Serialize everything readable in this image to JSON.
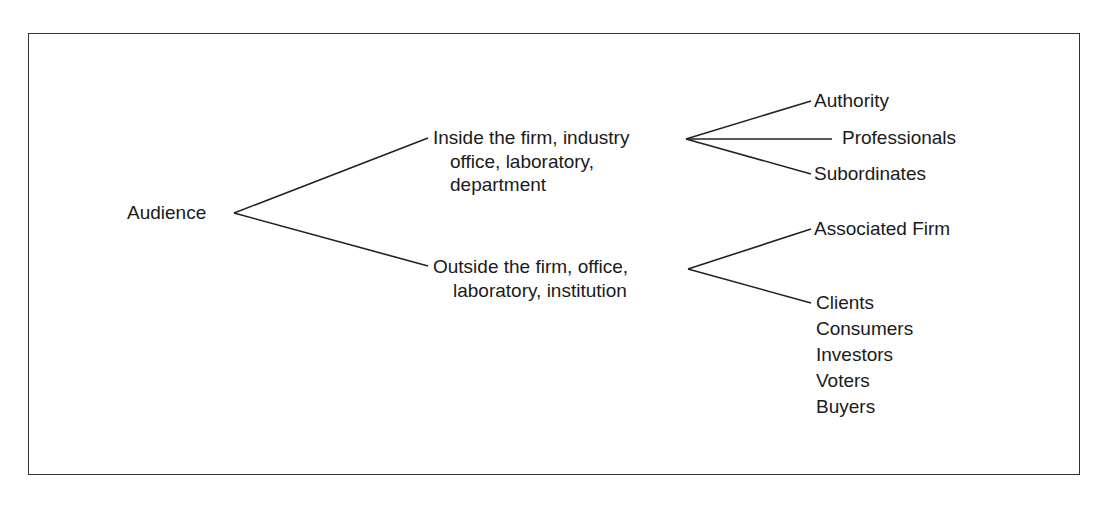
{
  "diagram": {
    "type": "tree",
    "root": "Audience",
    "branches": [
      {
        "label_lines": [
          "Inside the firm, industry",
          "office, laboratory,",
          "department"
        ],
        "children": [
          "Authority",
          "Professionals",
          "Subordinates"
        ]
      },
      {
        "label_lines": [
          "Outside the firm, office,",
          "laboratory, institution"
        ],
        "children": [
          "Associated Firm",
          "Clients\nConsumers\nInvestors\nVoters\nBuyers"
        ]
      }
    ],
    "outside_leaf_list": [
      "Clients",
      "Consumers",
      "Investors",
      "Voters",
      "Buyers"
    ],
    "line_color": "#222222",
    "border_color": "#333333"
  }
}
